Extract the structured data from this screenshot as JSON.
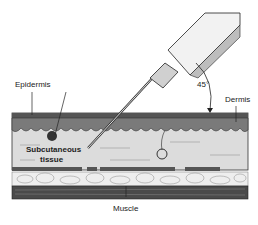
{
  "diagram": {
    "labels": {
      "epidermis": "Epidermis",
      "dermis": "Dermis",
      "angle": "45°",
      "subcutaneous_line1": "Subcutaneous",
      "subcutaneous_line2": "tissue",
      "muscle": "Muscle"
    },
    "colors": {
      "background": "#ffffff",
      "epidermis": "#555555",
      "dermis": "#7a7a7a",
      "subcutaneous": "#dcdcdc",
      "fat": "#eeeeee",
      "muscle": "#4a4a4a",
      "syringe_body": "#e8e8e8",
      "syringe_plunger": "#bdbdbd",
      "outline": "#222222"
    }
  }
}
